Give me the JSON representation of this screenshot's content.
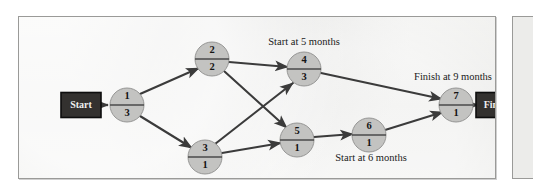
{
  "diagram": {
    "type": "project-network-diagram",
    "background_color": "#ececea",
    "border_color": "#9a9a98",
    "node_fill_color": "#c3c3c1",
    "edge_color": "#3b3b3b",
    "terminal_fill_color": "#33312f",
    "terminal_text_color": "#efefef",
    "start_terminal": {
      "label": "Start",
      "x": 62,
      "y": 88,
      "width": 40,
      "height": 25
    },
    "finish_terminal": {
      "label": "Finish",
      "x": 478,
      "y": 88,
      "width": 42,
      "height": 25
    },
    "nodes": [
      {
        "id": "n1",
        "top": "1",
        "bottom": "3",
        "x": 108,
        "y": 88,
        "r": 17
      },
      {
        "id": "n2",
        "top": "2",
        "bottom": "2",
        "x": 193,
        "y": 42,
        "r": 17
      },
      {
        "id": "n3",
        "top": "3",
        "bottom": "1",
        "x": 186,
        "y": 140,
        "r": 17
      },
      {
        "id": "n4",
        "top": "4",
        "bottom": "3",
        "x": 285,
        "y": 52,
        "r": 17
      },
      {
        "id": "n5",
        "top": "5",
        "bottom": "1",
        "x": 278,
        "y": 123,
        "r": 17
      },
      {
        "id": "n6",
        "top": "6",
        "bottom": "1",
        "x": 350,
        "y": 118,
        "r": 17
      },
      {
        "id": "n7",
        "top": "7",
        "bottom": "1",
        "x": 437,
        "y": 88,
        "r": 17
      }
    ],
    "edges": [
      {
        "from": "start",
        "to": "n1",
        "arrow": true
      },
      {
        "from": "n1",
        "to": "n2",
        "arrow": true
      },
      {
        "from": "n1",
        "to": "n3",
        "arrow": true
      },
      {
        "from": "n2",
        "to": "n4",
        "arrow": true
      },
      {
        "from": "n2",
        "to": "n5",
        "arrow": true
      },
      {
        "from": "n3",
        "to": "n4",
        "arrow": true
      },
      {
        "from": "n3",
        "to": "n5",
        "arrow": true
      },
      {
        "from": "n4",
        "to": "n7",
        "arrow": true
      },
      {
        "from": "n5",
        "to": "n6",
        "arrow": true
      },
      {
        "from": "n6",
        "to": "n7",
        "arrow": true
      },
      {
        "from": "n7",
        "to": "finish",
        "arrow": true
      }
    ],
    "annotations": [
      {
        "id": "a-start5",
        "text": "Start at 5 months",
        "x": 285,
        "y": 26
      },
      {
        "id": "a-finish9",
        "text": "Finish at 9 months",
        "x": 434,
        "y": 61
      },
      {
        "id": "a-start3",
        "text": "Start at 3 months",
        "x": 188,
        "y": 166
      },
      {
        "id": "a-start6",
        "text": "Start at 6 months",
        "x": 352,
        "y": 142
      }
    ]
  }
}
